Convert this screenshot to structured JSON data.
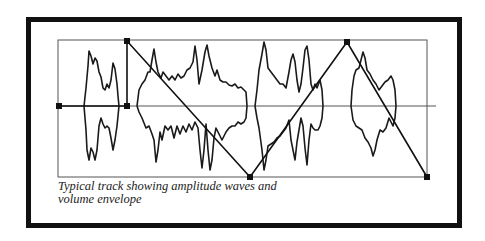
{
  "figure": {
    "caption_line1": "Typical track showing amplitude waves and",
    "caption_line2": "volume envelope",
    "colors": {
      "frame": "#111111",
      "line": "#222222",
      "box": "#555555",
      "background": "#ffffff"
    }
  },
  "track": {
    "box": {
      "x": 58,
      "y": 40,
      "width": 369,
      "height": 137
    },
    "center_line_y": 106,
    "center_line_x_end": 436,
    "wave_clips": [
      {
        "name": "clip-1",
        "x_start": 79,
        "x_end": 119
      },
      {
        "name": "clip-2",
        "x_start": 137,
        "x_end": 247
      },
      {
        "name": "clip-3",
        "x_start": 255,
        "x_end": 336
      },
      {
        "name": "clip-4",
        "x_start": 350,
        "x_end": 398
      }
    ],
    "volume_envelope": {
      "points": [
        [
          59,
          106
        ],
        [
          127,
          106
        ],
        [
          127,
          41
        ],
        [
          250,
          177
        ],
        [
          347,
          42
        ],
        [
          427,
          177
        ]
      ]
    }
  }
}
